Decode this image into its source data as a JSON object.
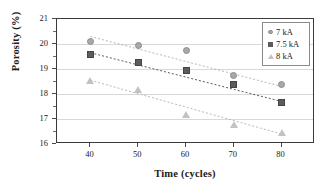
{
  "chart_data": {
    "type": "scatter",
    "title": "",
    "xlabel": "Time (cycles)",
    "ylabel": "Porosity (%)",
    "x": [
      40,
      50,
      60,
      70,
      80
    ],
    "xticklabels": [
      "40",
      "50",
      "60",
      "70",
      "80"
    ],
    "yticklabels": [
      "16",
      "17",
      "18",
      "19",
      "20",
      "21"
    ],
    "xlim": [
      33,
      87
    ],
    "ylim": [
      16,
      21
    ],
    "grid": "horizontal",
    "legend_position": "top-right",
    "series": [
      {
        "name": "7 kA",
        "marker": "circle",
        "color": "#a8a8a8",
        "values": [
          20.1,
          19.95,
          19.75,
          18.75,
          18.4
        ],
        "trendline": {
          "x0": 40,
          "y0": 20.3,
          "x1": 80,
          "y1": 18.3
        }
      },
      {
        "name": "7.5 kA",
        "marker": "square",
        "color": "#5c5c5c",
        "values": [
          19.6,
          19.25,
          18.95,
          18.4,
          17.65
        ],
        "trendline": {
          "x0": 40,
          "y0": 19.65,
          "x1": 80,
          "y1": 17.7
        }
      },
      {
        "name": "8 kA",
        "marker": "triangle",
        "color": "#c2c2c2",
        "values": [
          18.55,
          18.2,
          17.2,
          16.8,
          16.45
        ],
        "trendline": {
          "x0": 40,
          "y0": 18.55,
          "x1": 80,
          "y1": 16.4
        }
      }
    ]
  },
  "legend": {
    "items": [
      {
        "label": "7 kA",
        "marker": "circle"
      },
      {
        "label": "7.5 kA",
        "marker": "square"
      },
      {
        "label": "8 kA",
        "marker": "triangle"
      }
    ]
  },
  "axes": {
    "y_title": "Porosity (%)",
    "x_title": "Time (cycles)"
  }
}
